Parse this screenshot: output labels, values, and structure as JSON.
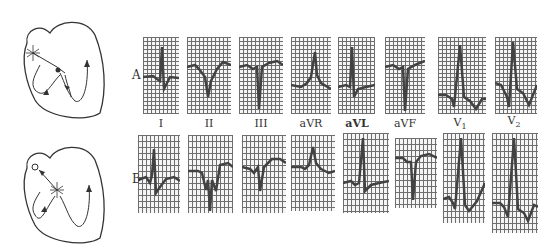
{
  "rows": [
    {
      "label": "A"
    },
    {
      "label": "B"
    }
  ],
  "leads": [
    {
      "label": "I"
    },
    {
      "label": "II"
    },
    {
      "label": "III"
    },
    {
      "label": "aVR"
    },
    {
      "label": "aVL"
    },
    {
      "label": "aVF"
    },
    {
      "label": "V",
      "sub": "1"
    },
    {
      "label": "V",
      "sub": "2"
    }
  ],
  "colors": {
    "trace": "#222222",
    "grid": "#555555",
    "line": "#333333"
  }
}
